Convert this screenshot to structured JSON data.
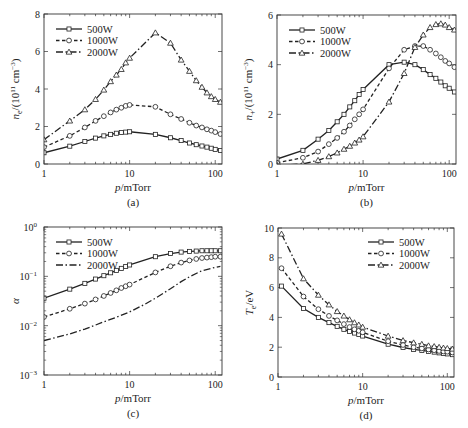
{
  "figure": {
    "panels": [
      "a",
      "b",
      "c",
      "d"
    ]
  },
  "chart_data": [
    {
      "id": "a",
      "type": "line",
      "caption": "(a)",
      "xlabel": "p/mTorr",
      "ylabel": "n_e/(10^11 cm^-3)",
      "xscale": "log",
      "xlim": [
        1,
        120
      ],
      "ylim": [
        0,
        8
      ],
      "xticks": [
        1,
        10,
        100
      ],
      "xtick_labels": [
        "1",
        "10",
        "100"
      ],
      "yticks": [
        0,
        2,
        4,
        6,
        8
      ],
      "ytick_labels": [
        "0",
        "2",
        "4",
        "6",
        "8"
      ],
      "legend_position": "upper-left",
      "box": {
        "left": 44,
        "right": 222,
        "top": 14,
        "bottom": 164
      },
      "series": [
        {
          "name": "500W",
          "style": "solid",
          "marker": "square",
          "x": [
            1,
            2,
            3,
            4,
            5,
            6,
            7,
            8,
            9,
            10,
            20,
            30,
            40,
            50,
            60,
            70,
            80,
            90,
            100,
            115
          ],
          "y": [
            0.6,
            0.95,
            1.2,
            1.38,
            1.5,
            1.58,
            1.64,
            1.68,
            1.7,
            1.72,
            1.58,
            1.4,
            1.25,
            1.12,
            1.03,
            0.96,
            0.9,
            0.84,
            0.78,
            0.72
          ]
        },
        {
          "name": "1000W",
          "style": "dashed",
          "marker": "circle",
          "x": [
            1,
            2,
            3,
            4,
            5,
            6,
            7,
            8,
            9,
            10,
            20,
            30,
            40,
            50,
            60,
            70,
            80,
            90,
            100,
            115
          ],
          "y": [
            0.9,
            1.5,
            1.95,
            2.3,
            2.55,
            2.75,
            2.9,
            3.0,
            3.1,
            3.15,
            3.05,
            2.65,
            2.4,
            2.2,
            2.05,
            1.95,
            1.85,
            1.78,
            1.7,
            1.6
          ]
        },
        {
          "name": "2000W",
          "style": "dashdot",
          "marker": "triangle",
          "x": [
            1,
            2,
            3,
            4,
            5,
            6,
            7,
            8,
            9,
            10,
            20,
            30,
            40,
            50,
            60,
            70,
            80,
            90,
            100,
            115
          ],
          "y": [
            1.3,
            2.3,
            2.9,
            3.45,
            3.95,
            4.4,
            4.75,
            5.05,
            5.4,
            5.65,
            7.0,
            6.45,
            5.55,
            4.95,
            4.45,
            4.1,
            3.8,
            3.6,
            3.45,
            3.3
          ]
        }
      ]
    },
    {
      "id": "b",
      "type": "line",
      "caption": "(b)",
      "xlabel": "p/mTorr",
      "ylabel": "n_+/(10^11 cm^-3)",
      "xscale": "log",
      "xlim": [
        1,
        120
      ],
      "ylim": [
        0,
        6
      ],
      "xticks": [
        1,
        10,
        100
      ],
      "xtick_labels": [
        "1",
        "10",
        "100"
      ],
      "yticks": [
        0,
        2,
        4,
        6
      ],
      "ytick_labels": [
        "0",
        "2",
        "4",
        "6"
      ],
      "legend_position": "upper-left",
      "box": {
        "left": 277,
        "right": 456,
        "top": 15,
        "bottom": 164
      },
      "series": [
        {
          "name": "500W",
          "style": "solid",
          "marker": "square",
          "x": [
            1,
            2,
            3,
            4,
            5,
            6,
            7,
            8,
            9,
            10,
            20,
            30,
            40,
            50,
            60,
            70,
            80,
            90,
            100,
            115
          ],
          "y": [
            0.2,
            0.55,
            1.0,
            1.35,
            1.7,
            2.0,
            2.3,
            2.55,
            2.8,
            3.0,
            4.0,
            4.1,
            4.0,
            3.8,
            3.6,
            3.45,
            3.3,
            3.15,
            3.05,
            2.9
          ]
        },
        {
          "name": "1000W",
          "style": "dashed",
          "marker": "circle",
          "x": [
            1,
            2,
            3,
            4,
            5,
            6,
            7,
            8,
            9,
            10,
            20,
            30,
            40,
            50,
            60,
            70,
            80,
            90,
            100,
            115
          ],
          "y": [
            0.05,
            0.25,
            0.5,
            0.8,
            1.05,
            1.3,
            1.55,
            1.8,
            2.0,
            2.2,
            3.85,
            4.6,
            4.75,
            4.75,
            4.6,
            4.45,
            4.3,
            4.15,
            4.05,
            3.9
          ]
        },
        {
          "name": "2000W",
          "style": "dashdot",
          "marker": "triangle",
          "x": [
            1,
            2,
            3,
            4,
            5,
            6,
            7,
            8,
            9,
            10,
            20,
            30,
            40,
            50,
            60,
            70,
            80,
            90,
            100,
            115
          ],
          "y": [
            -0.05,
            0.0,
            0.15,
            0.3,
            0.45,
            0.6,
            0.72,
            0.85,
            0.97,
            1.1,
            2.5,
            3.65,
            4.7,
            5.2,
            5.5,
            5.62,
            5.65,
            5.6,
            5.5,
            5.4
          ]
        }
      ]
    },
    {
      "id": "c",
      "type": "line",
      "caption": "(c)",
      "xlabel": "p/mTorr",
      "ylabel": "α",
      "xscale": "log",
      "yscale": "log",
      "xlim": [
        1,
        120
      ],
      "ylim": [
        0.001,
        1
      ],
      "xticks": [
        1,
        10,
        100
      ],
      "xtick_labels": [
        "1",
        "10",
        "100"
      ],
      "yticks": [
        0.001,
        0.01,
        0.1,
        1
      ],
      "ytick_labels": [
        "10^-3",
        "10^-2",
        "10^-1",
        "10^0"
      ],
      "legend_position": "upper-left",
      "box": {
        "left": 44,
        "right": 222,
        "top": 227,
        "bottom": 375
      },
      "series": [
        {
          "name": "500W",
          "style": "solid",
          "marker": "square",
          "x": [
            1,
            2,
            3,
            4,
            5,
            6,
            7,
            8,
            9,
            10,
            20,
            30,
            40,
            50,
            60,
            70,
            80,
            90,
            100,
            115
          ],
          "y": [
            0.036,
            0.055,
            0.072,
            0.088,
            0.103,
            0.118,
            0.132,
            0.145,
            0.158,
            0.17,
            0.25,
            0.29,
            0.31,
            0.32,
            0.325,
            0.33,
            0.33,
            0.33,
            0.33,
            0.33
          ]
        },
        {
          "name": "1000W",
          "style": "dashed",
          "marker": "circle",
          "x": [
            1,
            2,
            3,
            4,
            5,
            6,
            7,
            8,
            9,
            10,
            20,
            30,
            40,
            50,
            60,
            70,
            80,
            90,
            100,
            115
          ],
          "y": [
            0.015,
            0.022,
            0.028,
            0.034,
            0.04,
            0.046,
            0.052,
            0.058,
            0.063,
            0.068,
            0.12,
            0.16,
            0.19,
            0.21,
            0.225,
            0.235,
            0.24,
            0.245,
            0.25,
            0.25
          ]
        },
        {
          "name": "2000W",
          "style": "dashdot",
          "marker": "none",
          "x": [
            1,
            1.5,
            2,
            3,
            4,
            5,
            7,
            10,
            15,
            20,
            30,
            40,
            50,
            70,
            100,
            115
          ],
          "y": [
            0.005,
            0.006,
            0.0068,
            0.0085,
            0.0103,
            0.012,
            0.0148,
            0.019,
            0.027,
            0.036,
            0.056,
            0.078,
            0.098,
            0.13,
            0.152,
            0.16
          ]
        }
      ]
    },
    {
      "id": "d",
      "type": "line",
      "caption": "(d)",
      "xlabel": "p/mTorr",
      "ylabel": "T_e/eV",
      "xscale": "log",
      "xlim": [
        1,
        120
      ],
      "ylim": [
        0,
        10
      ],
      "xticks": [
        1,
        10,
        100
      ],
      "xtick_labels": [
        "1",
        "10",
        "100"
      ],
      "yticks": [
        0,
        2,
        4,
        6,
        8,
        10
      ],
      "ytick_labels": [
        "0",
        "2",
        "4",
        "6",
        "8",
        "10"
      ],
      "legend_position": "upper-right",
      "box": {
        "left": 278,
        "right": 454,
        "top": 228,
        "bottom": 377
      },
      "series": [
        {
          "name": "500W",
          "style": "solid",
          "marker": "square",
          "x": [
            1.1,
            2,
            3,
            4,
            5,
            6,
            7,
            8,
            9,
            10,
            20,
            30,
            40,
            50,
            60,
            70,
            80,
            90,
            100,
            115
          ],
          "y": [
            6.1,
            4.6,
            4.0,
            3.65,
            3.4,
            3.2,
            3.05,
            2.95,
            2.85,
            2.75,
            2.2,
            1.98,
            1.85,
            1.78,
            1.72,
            1.67,
            1.62,
            1.58,
            1.55,
            1.5
          ]
        },
        {
          "name": "1000W",
          "style": "dashed",
          "marker": "circle",
          "x": [
            1.1,
            2,
            3,
            4,
            5,
            6,
            7,
            8,
            9,
            10,
            20,
            30,
            40,
            50,
            60,
            70,
            80,
            90,
            100,
            115
          ],
          "y": [
            7.3,
            5.4,
            4.55,
            4.1,
            3.8,
            3.55,
            3.35,
            3.2,
            3.1,
            3.0,
            2.4,
            2.15,
            2.0,
            1.92,
            1.85,
            1.8,
            1.75,
            1.72,
            1.7,
            1.65
          ]
        },
        {
          "name": "2000W",
          "style": "dashdot",
          "marker": "triangle",
          "x": [
            1.1,
            2,
            3,
            4,
            5,
            6,
            7,
            8,
            9,
            10,
            20,
            30,
            40,
            50,
            60,
            70,
            80,
            90,
            100,
            115
          ],
          "y": [
            9.6,
            6.6,
            5.5,
            4.85,
            4.4,
            4.1,
            3.85,
            3.65,
            3.5,
            3.35,
            2.75,
            2.45,
            2.3,
            2.2,
            2.1,
            2.05,
            2.0,
            1.95,
            1.92,
            1.88
          ]
        }
      ]
    }
  ]
}
